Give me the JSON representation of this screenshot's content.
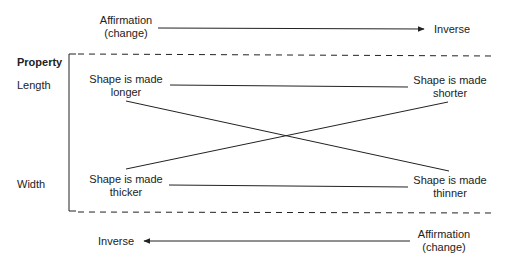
{
  "top": {
    "left_label_line1": "Affirmation",
    "left_label_line2": "(change)",
    "right_label": "Inverse"
  },
  "bottom": {
    "left_label": "Inverse",
    "right_label_line1": "Affirmation",
    "right_label_line2": "(change)"
  },
  "properties": {
    "heading": "Property",
    "length": "Length",
    "width": "Width"
  },
  "nodes": {
    "longer_line1": "Shape is made",
    "longer_line2": "longer",
    "shorter_line1": "Shape is made",
    "shorter_line2": "shorter",
    "thicker_line1": "Shape is made",
    "thicker_line2": "thicker",
    "thinner_line1": "Shape is made",
    "thinner_line2": "thinner"
  },
  "colors": {
    "line": "#222222",
    "text": "#222222"
  }
}
